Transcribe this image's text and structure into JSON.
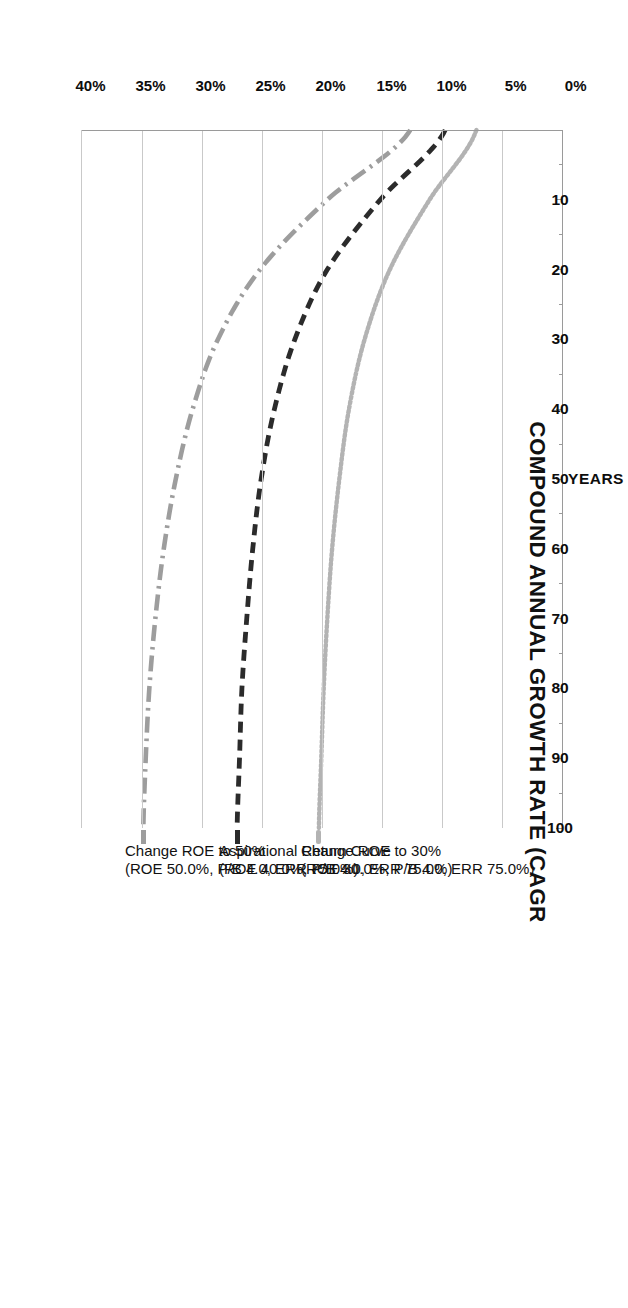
{
  "chart_data": {
    "type": "line",
    "title": "COMPOUND ANNUAL GROWTH RATE (CAGR",
    "xlabel": "YEARS",
    "ylabel": "COMPOUND ANNUAL GROWTH RATE (CAGR)",
    "orientation": "rotated-90-clockwise",
    "grid": true,
    "legend_position": "inline-annotations-at-curve-ends",
    "x": [
      0,
      10,
      20,
      30,
      40,
      50,
      60,
      70,
      80,
      90,
      100
    ],
    "xlim": [
      0,
      100
    ],
    "ylim": [
      0,
      40
    ],
    "x_tick_labels": [
      "",
      "10",
      "20",
      "30",
      "40",
      "50",
      "60",
      "70",
      "80",
      "90",
      "100"
    ],
    "y_tick_labels": [
      "0%",
      "5%",
      "10%",
      "15%",
      "20%",
      "25%",
      "30%",
      "35%",
      "40%"
    ],
    "y_ticks": [
      0,
      5,
      10,
      15,
      20,
      25,
      30,
      35,
      40
    ],
    "series": [
      {
        "name": "Change ROE to 30%",
        "sub": "(ROE 30.0%, P/B 4.0, ERR 75.0%)",
        "style": "dotted",
        "color": "#b3b3b3",
        "label_lines": [
          "Change ROE to 30%",
          "(ROE 30.0%, P/B 4.0, ERR 75.0%)"
        ],
        "values": [
          7.2,
          11.1,
          14.4,
          16.5,
          17.8,
          18.6,
          19.2,
          19.6,
          19.9,
          20.1,
          20.3
        ],
        "asymptote": 20.5
      },
      {
        "name": "Aspirational Return Curve",
        "sub": "(ROE 40.0%, P/B 4.0, ERR 75.0%)",
        "style": "dashed",
        "color": "#2b2b2b",
        "label_lines": [
          "Aspirational Return Curve",
          "(ROE 40.0%, P/B 4.0, ERR 75.0%)"
        ],
        "values": [
          9.8,
          15.2,
          19.6,
          22.3,
          24.0,
          25.1,
          25.8,
          26.3,
          26.7,
          26.9,
          27.1
        ],
        "asymptote": 27.4
      },
      {
        "name": "Change ROE to 50%",
        "sub": "(ROE 50.0%, P/B 4.0, ERR 75.0%)",
        "style": "dash-dot",
        "color": "#9d9d9d",
        "label_lines": [
          "Change ROE to 50%",
          "(ROE 50.0%, P/B 4.0, ERR 75.0%)"
        ],
        "values": [
          12.7,
          19.6,
          25.2,
          28.7,
          30.8,
          32.2,
          33.2,
          33.9,
          34.4,
          34.7,
          34.9
        ],
        "asymptote": 35.2
      }
    ]
  },
  "axis": {
    "title": "COMPOUND ANNUAL GROWTH RATE (CAGR",
    "years_title": "YEARS",
    "cagr_ticks": [
      "0%",
      "5%",
      "10%",
      "15%",
      "20%",
      "25%",
      "30%",
      "35%",
      "40%"
    ],
    "year_ticks": [
      "10",
      "20",
      "30",
      "40",
      "50",
      "60",
      "70",
      "80",
      "90",
      "100"
    ]
  },
  "colors": {
    "grid": "#c9c9c9",
    "axis": "#9a9a9a",
    "text": "#111111",
    "series_light_gray": "#b3b3b3",
    "series_black": "#2b2b2b",
    "series_mid_gray": "#9d9d9d"
  }
}
